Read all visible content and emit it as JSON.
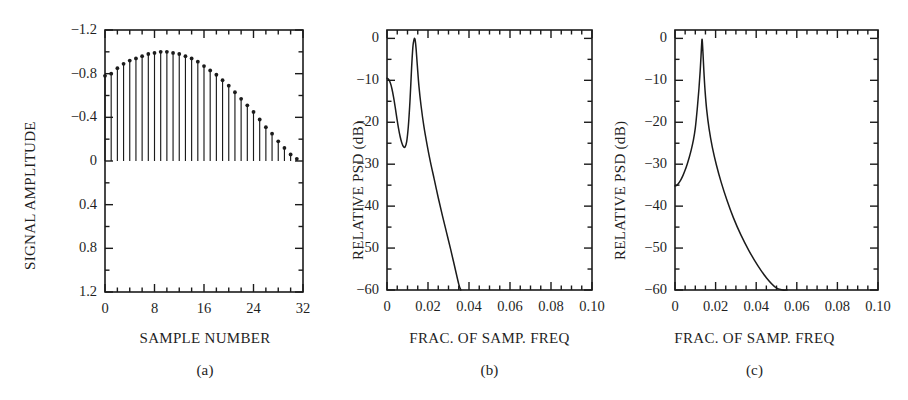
{
  "figure": {
    "background": "#ffffff",
    "ink_color": "#1b1b1b",
    "panels": [
      {
        "id": "a",
        "caption": "(a)",
        "xlabel": "SAMPLE NUMBER",
        "ylabel": "SIGNAL AMPLITUDE",
        "xticks": [
          "0",
          "8",
          "16",
          "24",
          "32"
        ],
        "yticks": [
          "1.2",
          "0.8",
          "0.4",
          "0",
          "−0.4",
          "−0.8",
          "−1.2"
        ]
      },
      {
        "id": "b",
        "caption": "(b)",
        "xlabel": "FRAC. OF SAMP. FREQ",
        "ylabel": "RELATIVE PSD (dB)",
        "xticks": [
          "0",
          "0.02",
          "0.04",
          "0.06",
          "0.08",
          "0.10"
        ],
        "yticks": [
          "0",
          "−10",
          "−20",
          "−30",
          "−40",
          "−50",
          "−60"
        ]
      },
      {
        "id": "c",
        "caption": "(c)",
        "xlabel": "FRAC. OF SAMP. FREQ",
        "ylabel": "RELATIVE PSD (dB)",
        "xticks": [
          "0",
          "0.02",
          "0.04",
          "0.06",
          "0.08",
          "0.10"
        ],
        "yticks": [
          "0",
          "−10",
          "−20",
          "−30",
          "−40",
          "−50",
          "−60"
        ]
      }
    ]
  },
  "chart_data": [
    {
      "type": "bar",
      "panel": "a",
      "title": "",
      "xlabel": "SAMPLE NUMBER",
      "ylabel": "SIGNAL AMPLITUDE",
      "xlim": [
        0,
        32
      ],
      "ylim": [
        -1.2,
        1.2
      ],
      "xticks": [
        0,
        8,
        16,
        24,
        32
      ],
      "yticks": [
        -1.2,
        -0.8,
        -0.4,
        0,
        0.4,
        0.8,
        1.2
      ],
      "minor_tick_step_x": 2,
      "minor_tick_step_y": 0.2,
      "grid": false,
      "legend": null,
      "marker": "filled-circle",
      "note": "stem plot, stems drawn from y=0 up to each value",
      "categories": [
        0,
        1,
        2,
        3,
        4,
        5,
        6,
        7,
        8,
        9,
        10,
        11,
        12,
        13,
        14,
        15,
        16,
        17,
        18,
        19,
        20,
        21,
        22,
        23,
        24,
        25,
        26,
        27,
        28,
        29,
        30,
        31
      ],
      "values": [
        0.78,
        0.8,
        0.85,
        0.89,
        0.92,
        0.94,
        0.96,
        0.98,
        0.99,
        1.0,
        1.0,
        0.99,
        0.98,
        0.96,
        0.94,
        0.91,
        0.87,
        0.83,
        0.79,
        0.74,
        0.69,
        0.63,
        0.57,
        0.51,
        0.45,
        0.38,
        0.31,
        0.25,
        0.18,
        0.12,
        0.06,
        0.02
      ]
    },
    {
      "type": "line",
      "panel": "b",
      "title": "",
      "xlabel": "FRAC. OF SAMP. FREQ",
      "ylabel": "RELATIVE PSD (dB)",
      "xlim": [
        0,
        0.1
      ],
      "ylim": [
        -60,
        2
      ],
      "xticks": [
        0,
        0.02,
        0.04,
        0.06,
        0.08,
        0.1
      ],
      "yticks": [
        0,
        -10,
        -20,
        -30,
        -40,
        -50,
        -60
      ],
      "minor_tick_step_x": 0.005,
      "minor_tick_step_y": 5,
      "grid": false,
      "legend": null,
      "annotations": [
        "peak at f ≈ 0.0135 reaching 0 dB",
        "local minimum ≈ −26 dB near f ≈ 0.008",
        "curve falls below −60 dB near f ≈ 0.036"
      ],
      "x": [
        0.0,
        0.0008,
        0.0016,
        0.0024,
        0.0032,
        0.004,
        0.0048,
        0.0056,
        0.0064,
        0.0072,
        0.008,
        0.0088,
        0.0096,
        0.0104,
        0.0112,
        0.012,
        0.0126,
        0.013,
        0.0133,
        0.0135,
        0.0138,
        0.0142,
        0.0148,
        0.0156,
        0.0166,
        0.018,
        0.0196,
        0.0212,
        0.023,
        0.025,
        0.027,
        0.029,
        0.031,
        0.033,
        0.035,
        0.036
      ],
      "y": [
        -9.5,
        -9.8,
        -10.6,
        -12.0,
        -14.0,
        -16.4,
        -19.0,
        -21.4,
        -23.4,
        -24.9,
        -25.8,
        -25.9,
        -24.6,
        -21.0,
        -15.0,
        -7.0,
        -2.2,
        -0.7,
        -0.1,
        0.0,
        -0.6,
        -2.5,
        -6.5,
        -11.5,
        -16.0,
        -21.0,
        -25.5,
        -29.5,
        -33.5,
        -38.0,
        -42.2,
        -46.2,
        -50.2,
        -54.4,
        -58.6,
        -60.0
      ]
    },
    {
      "type": "line",
      "panel": "c",
      "title": "",
      "xlabel": "FRAC. OF SAMP. FREQ",
      "ylabel": "RELATIVE PSD (dB)",
      "xlim": [
        0,
        0.1
      ],
      "ylim": [
        -60,
        2
      ],
      "xticks": [
        0,
        0.02,
        0.04,
        0.06,
        0.08,
        0.1
      ],
      "yticks": [
        0,
        -10,
        -20,
        -30,
        -40,
        -50,
        -60
      ],
      "minor_tick_step_x": 0.005,
      "minor_tick_step_y": 5,
      "grid": false,
      "legend": null,
      "annotations": [
        "starts near −35 dB at f = 0",
        "single sharp peak at f ≈ 0.0133 reaching 0 dB",
        "curve falls below −60 dB near f ≈ 0.055"
      ],
      "x": [
        0.0,
        0.001,
        0.002,
        0.003,
        0.004,
        0.005,
        0.006,
        0.007,
        0.008,
        0.009,
        0.01,
        0.011,
        0.0118,
        0.0124,
        0.0128,
        0.0131,
        0.0133,
        0.0135,
        0.0138,
        0.0142,
        0.0148,
        0.0156,
        0.0168,
        0.0184,
        0.0204,
        0.0228,
        0.0256,
        0.0288,
        0.0324,
        0.0364,
        0.0408,
        0.0452,
        0.0496,
        0.053,
        0.0552
      ],
      "y": [
        -35.2,
        -35.0,
        -34.4,
        -33.6,
        -32.6,
        -31.4,
        -30.0,
        -28.4,
        -26.6,
        -24.4,
        -21.4,
        -16.6,
        -12.0,
        -7.8,
        -4.4,
        -1.6,
        -0.2,
        -1.0,
        -3.6,
        -7.6,
        -12.4,
        -17.0,
        -21.6,
        -26.0,
        -30.2,
        -34.4,
        -38.6,
        -42.8,
        -46.8,
        -50.6,
        -54.2,
        -57.2,
        -59.4,
        -60.0,
        -60.0
      ]
    }
  ]
}
